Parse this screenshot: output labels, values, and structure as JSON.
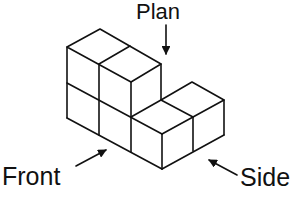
{
  "figure": {
    "stroke_color": "#111111",
    "background": "#ffffff"
  },
  "labels": {
    "plan": "Plan",
    "front": "Front",
    "side": "Side"
  },
  "arrows": [
    {
      "name": "plan-arrow",
      "points_to": "top of solid"
    },
    {
      "name": "front-arrow",
      "points_to": "front face"
    },
    {
      "name": "side-arrow",
      "points_to": "side face"
    }
  ],
  "cubes": {
    "count": 6,
    "layout": "L-shaped: 2x2 block stacked 2 high on the left, 2 cubes single-height extending to the right"
  }
}
